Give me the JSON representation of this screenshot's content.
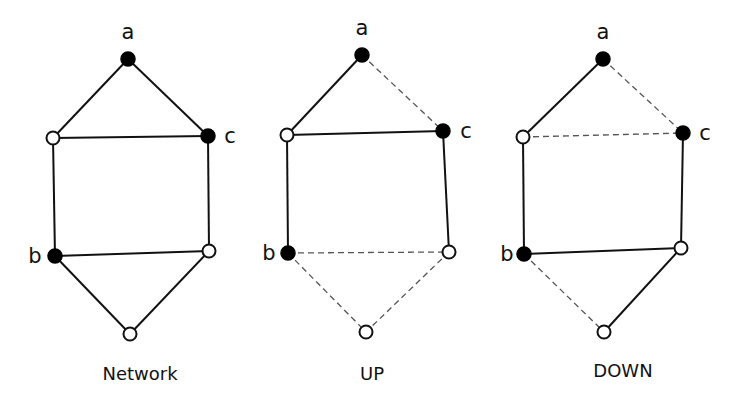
{
  "diagram": {
    "node_radius": 7,
    "graphs": [
      {
        "caption": "Network",
        "caption_pos": [
          140,
          380
        ],
        "nodes": [
          {
            "id": "a",
            "x": 128,
            "y": 59,
            "filled": true,
            "label": "a",
            "label_pos": [
              128,
              39
            ]
          },
          {
            "id": "lt",
            "x": 53,
            "y": 138,
            "filled": false,
            "label": ""
          },
          {
            "id": "c",
            "x": 208,
            "y": 136,
            "filled": true,
            "label": "c",
            "label_pos": [
              230,
              143
            ]
          },
          {
            "id": "b",
            "x": 55,
            "y": 256,
            "filled": true,
            "label": "b",
            "label_pos": [
              35,
              263
            ]
          },
          {
            "id": "rb",
            "x": 209,
            "y": 251,
            "filled": false,
            "label": ""
          },
          {
            "id": "bt",
            "x": 130,
            "y": 334,
            "filled": false,
            "label": ""
          }
        ],
        "edges": [
          {
            "from": "a",
            "to": "lt",
            "style": "solid"
          },
          {
            "from": "a",
            "to": "c",
            "style": "solid"
          },
          {
            "from": "lt",
            "to": "c",
            "style": "solid"
          },
          {
            "from": "lt",
            "to": "b",
            "style": "solid"
          },
          {
            "from": "c",
            "to": "rb",
            "style": "solid"
          },
          {
            "from": "b",
            "to": "rb",
            "style": "solid"
          },
          {
            "from": "b",
            "to": "bt",
            "style": "solid"
          },
          {
            "from": "rb",
            "to": "bt",
            "style": "solid"
          }
        ]
      },
      {
        "caption": "UP",
        "caption_pos": [
          372,
          380
        ],
        "nodes": [
          {
            "id": "a",
            "x": 362,
            "y": 55,
            "filled": true,
            "label": "a",
            "label_pos": [
              362,
              35
            ]
          },
          {
            "id": "lt",
            "x": 287,
            "y": 135,
            "filled": false,
            "label": ""
          },
          {
            "id": "c",
            "x": 443,
            "y": 131,
            "filled": true,
            "label": "c",
            "label_pos": [
              466,
              138
            ]
          },
          {
            "id": "b",
            "x": 288,
            "y": 253,
            "filled": true,
            "label": "b",
            "label_pos": [
              269,
              260
            ]
          },
          {
            "id": "rb",
            "x": 449,
            "y": 252,
            "filled": false,
            "label": ""
          },
          {
            "id": "bt",
            "x": 366,
            "y": 332,
            "filled": false,
            "label": ""
          }
        ],
        "edges": [
          {
            "from": "a",
            "to": "lt",
            "style": "solid"
          },
          {
            "from": "a",
            "to": "c",
            "style": "dashed"
          },
          {
            "from": "lt",
            "to": "c",
            "style": "solid"
          },
          {
            "from": "lt",
            "to": "b",
            "style": "solid"
          },
          {
            "from": "c",
            "to": "rb",
            "style": "solid"
          },
          {
            "from": "b",
            "to": "rb",
            "style": "dashed"
          },
          {
            "from": "b",
            "to": "bt",
            "style": "dashed"
          },
          {
            "from": "rb",
            "to": "bt",
            "style": "dashed"
          }
        ]
      },
      {
        "caption": "DOWN",
        "caption_pos": [
          623,
          377
        ],
        "nodes": [
          {
            "id": "a",
            "x": 603,
            "y": 59,
            "filled": true,
            "label": "a",
            "label_pos": [
              603,
              39
            ]
          },
          {
            "id": "lt",
            "x": 523,
            "y": 137,
            "filled": false,
            "label": ""
          },
          {
            "id": "c",
            "x": 683,
            "y": 133,
            "filled": true,
            "label": "c",
            "label_pos": [
              705,
              140
            ]
          },
          {
            "id": "b",
            "x": 524,
            "y": 254,
            "filled": true,
            "label": "b",
            "label_pos": [
              507,
              261
            ]
          },
          {
            "id": "rb",
            "x": 681,
            "y": 248,
            "filled": false,
            "label": ""
          },
          {
            "id": "bt",
            "x": 604,
            "y": 332,
            "filled": false,
            "label": ""
          }
        ],
        "edges": [
          {
            "from": "a",
            "to": "lt",
            "style": "solid"
          },
          {
            "from": "a",
            "to": "c",
            "style": "dashed"
          },
          {
            "from": "lt",
            "to": "c",
            "style": "dashed"
          },
          {
            "from": "lt",
            "to": "b",
            "style": "solid"
          },
          {
            "from": "c",
            "to": "rb",
            "style": "solid"
          },
          {
            "from": "b",
            "to": "rb",
            "style": "solid"
          },
          {
            "from": "b",
            "to": "bt",
            "style": "dashed"
          },
          {
            "from": "rb",
            "to": "bt",
            "style": "solid"
          }
        ]
      }
    ]
  }
}
